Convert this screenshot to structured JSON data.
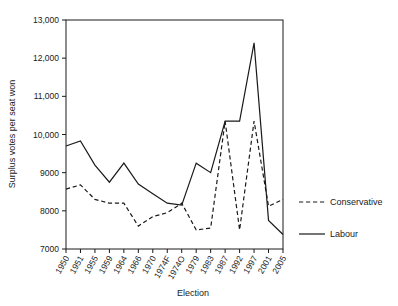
{
  "chart_data": {
    "type": "line",
    "title": "",
    "xlabel": "Election",
    "ylabel": "Surplus votes per seat won",
    "categories": [
      "1950",
      "1951",
      "1955",
      "1959",
      "1964",
      "1966",
      "1970",
      "1974F",
      "1974O",
      "1979",
      "1983",
      "1987",
      "1992",
      "1997",
      "2001",
      "2005"
    ],
    "series": [
      {
        "name": "Conservative",
        "style": "dashed",
        "color": "#1a1a1a",
        "values": [
          8570,
          8680,
          8300,
          8200,
          8200,
          7600,
          7850,
          7950,
          8200,
          7500,
          7550,
          10350,
          7500,
          10350,
          8120,
          8300
        ]
      },
      {
        "name": "Labour",
        "style": "solid",
        "color": "#1a1a1a",
        "values": [
          9700,
          9830,
          9200,
          8750,
          9250,
          8700,
          8450,
          8200,
          8150,
          9250,
          9000,
          10350,
          10350,
          12400,
          7750,
          7380
        ]
      }
    ],
    "ylim": [
      7000,
      13000
    ],
    "yticks": [
      7000,
      8000,
      9000,
      10000,
      11000,
      12000,
      13000
    ],
    "ytick_labels": [
      "7000",
      "8000",
      "9000",
      "10,000",
      "11,000",
      "12,000",
      "13,000"
    ],
    "grid": false,
    "legend_position": "right",
    "legend_entries": [
      {
        "label": "Conservative",
        "style": "dashed"
      },
      {
        "label": "Labour",
        "style": "solid"
      }
    ]
  }
}
